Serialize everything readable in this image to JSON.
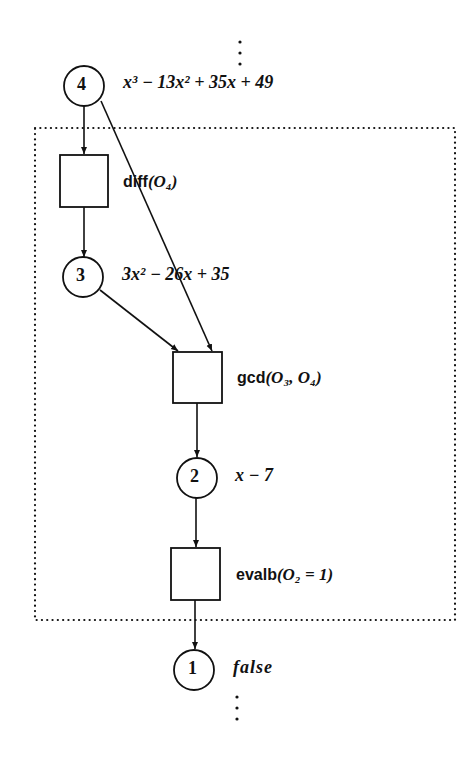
{
  "diagram": {
    "type": "dataflow-graph",
    "ellipsis_top": "⋮",
    "ellipsis_bottom": "⋮",
    "nodes": [
      {
        "id": "4",
        "label": "4",
        "value_text": "x³ − 13x² + 35x + 49"
      },
      {
        "id": "3",
        "label": "3",
        "value_text": "3x² − 26x + 35"
      },
      {
        "id": "2",
        "label": "2",
        "value_text": "x − 7"
      },
      {
        "id": "1",
        "label": "1",
        "value_text": "false"
      }
    ],
    "operations": [
      {
        "id": "diff",
        "name": "diff",
        "args_text": "(O₄)"
      },
      {
        "id": "gcd",
        "name": "gcd",
        "args_text": "(O₃, O₄)"
      },
      {
        "id": "evalb",
        "name": "evalb",
        "args_text": "(O₂ = 1)"
      }
    ],
    "edges": [
      [
        "4",
        "diff"
      ],
      [
        "diff",
        "3"
      ],
      [
        "3",
        "gcd"
      ],
      [
        "4",
        "gcd"
      ],
      [
        "gcd",
        "2"
      ],
      [
        "2",
        "evalb"
      ],
      [
        "evalb",
        "1"
      ]
    ],
    "colors": {
      "stroke": "#111111",
      "background": "#ffffff"
    }
  }
}
